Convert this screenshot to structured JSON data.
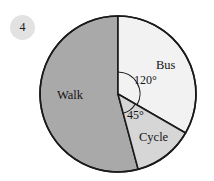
{
  "question": {
    "number": "4"
  },
  "chart_data": {
    "type": "pie",
    "title": "",
    "categories": [
      "Bus",
      "Cycle",
      "Walk"
    ],
    "values": [
      120,
      45,
      195
    ],
    "value_unit": "degrees",
    "percentages": [
      33.3,
      12.5,
      54.2
    ],
    "annotations": [
      "120°",
      "45°"
    ],
    "legend_position": "none",
    "grid": false,
    "slices": [
      {
        "label": "Bus",
        "angle_deg": 120,
        "angle_label": "120°",
        "start_deg": 0,
        "end_deg": 120,
        "color": "#f2f2f2"
      },
      {
        "label": "Cycle",
        "angle_deg": 45,
        "angle_label": "45°",
        "start_deg": 120,
        "end_deg": 165,
        "color": "#d6d6d6"
      },
      {
        "label": "Walk",
        "angle_deg": 195,
        "angle_label": "",
        "start_deg": 165,
        "end_deg": 360,
        "color": "#a9a9a9"
      }
    ],
    "geometry": {
      "center_x": 118,
      "center_y": 94,
      "radius": 78,
      "stroke_color": "#1a1a1a"
    }
  },
  "labels": {
    "walk": "Walk",
    "bus": "Bus",
    "cycle": "Cycle",
    "angle_120": "120°",
    "angle_45": "45°"
  },
  "colors": {
    "bus_fill": "#f2f2f2",
    "cycle_fill": "#d6d6d6",
    "walk_fill": "#a9a9a9",
    "outline": "#1a1a1a",
    "badge_bg": "#e2e2e2",
    "text": "#141414",
    "page_bg": "#ffffff"
  }
}
